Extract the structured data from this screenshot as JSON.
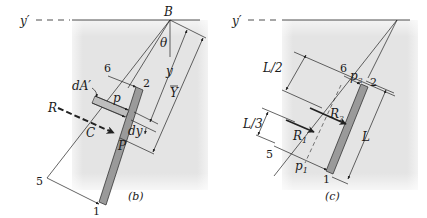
{
  "figure_b": {
    "caption": "(b)",
    "axis_label": "y′",
    "point_B": "B",
    "angle": "θ",
    "labels": {
      "dA": "dA′",
      "p": "p",
      "R": "R",
      "C": "C",
      "P": "P",
      "dy": "dy",
      "y": "y",
      "Ybar": "Y"
    },
    "points": [
      "6",
      "2",
      "5",
      "1"
    ]
  },
  "figure_c": {
    "caption": "(c)",
    "axis_label": "y′",
    "labels": {
      "L_half": "L/2",
      "L_third": "L/3",
      "p2": "p",
      "p2_sub": "2",
      "p1": "p",
      "p1_sub": "1",
      "R1": "R",
      "R1_sub": "1",
      "R2": "R",
      "R2_sub": "2",
      "L": "L"
    },
    "points": [
      "6",
      "2",
      "5",
      "1"
    ]
  },
  "colors": {
    "background": "#ffffff",
    "shade": "#e6e6e6",
    "plate": "#9a9a9a",
    "ink": "#1a1a1a"
  }
}
